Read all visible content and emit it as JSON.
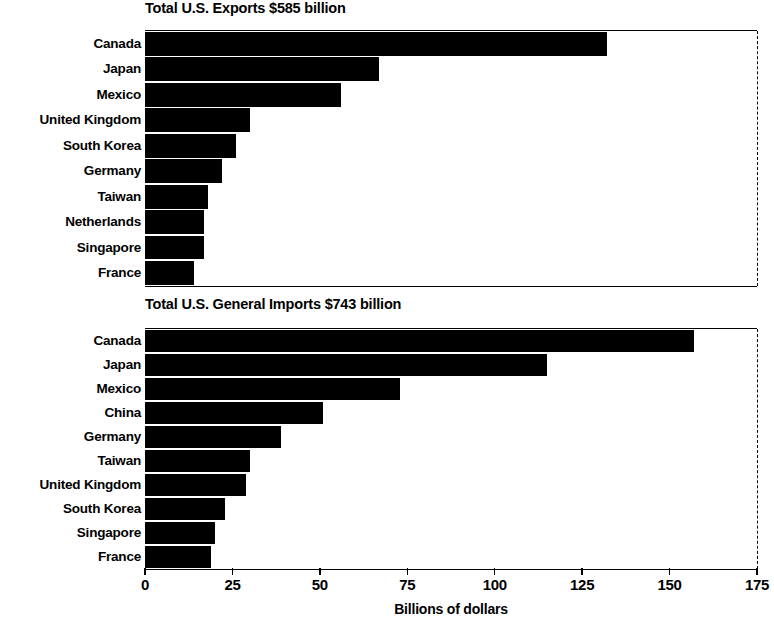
{
  "chart_data": [
    {
      "type": "bar",
      "orientation": "horizontal",
      "title": "Total U.S. Exports $585 billion",
      "xlabel": "Billions of dollars",
      "ylabel": "",
      "xlim": [
        0,
        175
      ],
      "xticks": [
        0,
        25,
        50,
        75,
        100,
        125,
        150,
        175
      ],
      "xticklabels": [
        "0",
        "25",
        "50",
        "75",
        "100",
        "125",
        "150",
        "175"
      ],
      "grid": false,
      "legend": false,
      "categories": [
        "Canada",
        "Japan",
        "Mexico",
        "United Kingdom",
        "South Korea",
        "Germany",
        "Taiwan",
        "Netherlands",
        "Singapore",
        "France"
      ],
      "values": [
        132,
        67,
        56,
        30,
        26,
        22,
        18,
        17,
        17,
        14
      ],
      "bar_color": "#000000"
    },
    {
      "type": "bar",
      "orientation": "horizontal",
      "title": "Total U.S. General Imports $743 billion",
      "xlabel": "Billions of dollars",
      "ylabel": "",
      "xlim": [
        0,
        175
      ],
      "xticks": [
        0,
        25,
        50,
        75,
        100,
        125,
        150,
        175
      ],
      "xticklabels": [
        "0",
        "25",
        "50",
        "75",
        "100",
        "125",
        "150",
        "175"
      ],
      "grid": false,
      "legend": false,
      "categories": [
        "Canada",
        "Japan",
        "Mexico",
        "China",
        "Germany",
        "Taiwan",
        "United Kingdom",
        "South Korea",
        "Singapore",
        "France"
      ],
      "values": [
        157,
        115,
        73,
        51,
        39,
        30,
        29,
        23,
        20,
        19
      ],
      "bar_color": "#000000"
    }
  ],
  "axis": {
    "title": "Billions of dollars",
    "ticks": [
      "0",
      "25",
      "50",
      "75",
      "100",
      "125",
      "150",
      "175"
    ]
  }
}
